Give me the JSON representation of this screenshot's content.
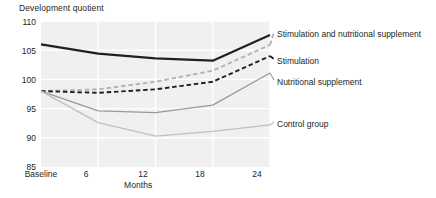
{
  "chart_data": {
    "type": "line",
    "title": "",
    "xlabel": "Months",
    "ylabel": "Development quotient",
    "ylim": [
      85,
      110
    ],
    "yticks": [
      "85",
      "90",
      "95",
      "100",
      "105",
      "110"
    ],
    "x": [
      0,
      6,
      12,
      18,
      24
    ],
    "categories": [
      "Baseline",
      "6",
      "12",
      "18",
      "24"
    ],
    "grid": true,
    "legend_position": "right-callouts",
    "annotations": [
      {
        "text_line1": "Children of normal",
        "text_line2": "height"
      }
    ],
    "series": [
      {
        "name": "Children of normal height",
        "style": "solid",
        "color": "#231f20",
        "width": 2.2,
        "values": [
          106.0,
          104.4,
          103.6,
          103.2,
          107.6
        ]
      },
      {
        "name": "Stimulation and nutritional supplement",
        "style": "dashed",
        "color": "#b3b3b3",
        "width": 1.9,
        "values": [
          98.0,
          98.3,
          99.6,
          101.5,
          105.9
        ]
      },
      {
        "name": "Stimulation",
        "style": "dashed",
        "color": "#231f20",
        "width": 1.9,
        "values": [
          98.0,
          97.7,
          98.3,
          99.6,
          104.0
        ]
      },
      {
        "name": "Nutritional supplement",
        "style": "solid",
        "color": "#999999",
        "width": 1.3,
        "values": [
          98.0,
          94.6,
          94.3,
          95.6,
          101.1
        ]
      },
      {
        "name": "Control group",
        "style": "solid",
        "color": "#bfbfbf",
        "width": 1.3,
        "values": [
          98.0,
          92.6,
          90.3,
          91.1,
          92.2
        ]
      }
    ]
  },
  "axis": {
    "y_title": "Development quotient",
    "x_title": "Months"
  },
  "yticks": {
    "t0": "110",
    "t1": "105",
    "t2": "100",
    "t3": "95",
    "t4": "90",
    "t5": "85"
  },
  "xticks": {
    "t0": "Baseline",
    "t1": "6",
    "t2": "12",
    "t3": "18",
    "t4": "24"
  },
  "annotation": {
    "line1": "Children of normal",
    "line2": "height"
  },
  "callouts": {
    "c0": "Stimulation and nutritional supplement",
    "c1": "Stimulation",
    "c2": "Nutritional supplement",
    "c3": "Control group"
  },
  "colors": {
    "plot_background": "#f0f0f0",
    "gridline": "#ffffff",
    "text": "#231f20",
    "normal_height_line": "#231f20",
    "stim_nutri_line": "#b3b3b3",
    "stimulation_line": "#231f20",
    "nutritional_line": "#999999",
    "control_line": "#bfbfbf"
  }
}
